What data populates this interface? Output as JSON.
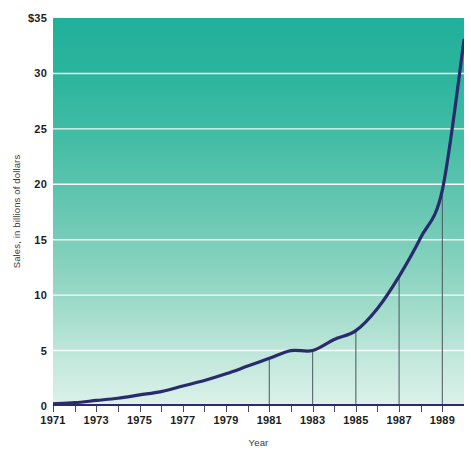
{
  "chart_data": {
    "type": "line",
    "title": "",
    "xlabel": "Year",
    "ylabel": "Sales, in billions of dollars",
    "xlim": [
      1971,
      1990
    ],
    "ylim": [
      0,
      35
    ],
    "grid": true,
    "legend": null,
    "y_ticks": [
      {
        "value": 35,
        "label": "$35"
      },
      {
        "value": 30,
        "label": "30"
      },
      {
        "value": 25,
        "label": "25"
      },
      {
        "value": 20,
        "label": "20"
      },
      {
        "value": 15,
        "label": "15"
      },
      {
        "value": 10,
        "label": "10"
      },
      {
        "value": 5,
        "label": "5"
      },
      {
        "value": 0,
        "label": "0"
      }
    ],
    "x_ticks": [
      {
        "value": 1971,
        "label": "1971"
      },
      {
        "value": 1972,
        "label": ""
      },
      {
        "value": 1973,
        "label": "1973"
      },
      {
        "value": 1974,
        "label": ""
      },
      {
        "value": 1975,
        "label": "1975"
      },
      {
        "value": 1976,
        "label": ""
      },
      {
        "value": 1977,
        "label": "1977"
      },
      {
        "value": 1978,
        "label": ""
      },
      {
        "value": 1979,
        "label": "1979"
      },
      {
        "value": 1980,
        "label": ""
      },
      {
        "value": 1981,
        "label": "1981"
      },
      {
        "value": 1982,
        "label": ""
      },
      {
        "value": 1983,
        "label": "1983"
      },
      {
        "value": 1984,
        "label": ""
      },
      {
        "value": 1985,
        "label": "1985"
      },
      {
        "value": 1986,
        "label": ""
      },
      {
        "value": 1987,
        "label": "1987"
      },
      {
        "value": 1988,
        "label": ""
      },
      {
        "value": 1989,
        "label": "1989"
      },
      {
        "value": 1990,
        "label": ""
      }
    ],
    "x": [
      1971,
      1972,
      1973,
      1974,
      1975,
      1976,
      1977,
      1978,
      1979,
      1980,
      1981,
      1982,
      1983,
      1984,
      1985,
      1986,
      1987,
      1988,
      1989,
      1990
    ],
    "values": [
      0.2,
      0.3,
      0.5,
      0.7,
      1.0,
      1.3,
      1.8,
      2.3,
      2.9,
      3.6,
      4.3,
      5.1,
      5.0,
      6.0,
      6.8,
      8.8,
      11.7,
      15.2,
      19.5,
      33.0
    ],
    "series": [
      {
        "name": "Sales",
        "color": "#2a2a6e",
        "values": [
          0.2,
          0.3,
          0.5,
          0.7,
          1.0,
          1.3,
          1.8,
          2.3,
          2.9,
          3.6,
          4.3,
          5.0,
          5.0,
          6.0,
          6.8,
          8.8,
          11.7,
          15.2,
          19.5,
          33.0
        ]
      }
    ],
    "droplines": [
      {
        "year": 1981,
        "value": 4.3
      },
      {
        "year": 1983,
        "value": 5.0
      },
      {
        "year": 1985,
        "value": 6.8
      },
      {
        "year": 1987,
        "value": 11.7
      },
      {
        "year": 1989,
        "value": 19.5
      }
    ],
    "colors": {
      "line": "#2a2a6e",
      "plot_gradient_top": "#21b09a",
      "plot_gradient_bottom": "#dcf1ea",
      "gridline": "#ffffff",
      "dropline": "#4a5a60",
      "axis": "#2a2a6e",
      "text": "#1c1c1c",
      "page_background": "#ffffff"
    }
  }
}
